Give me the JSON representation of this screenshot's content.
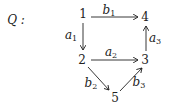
{
  "diagram": {
    "title": "Q :",
    "nodes": [
      {
        "id": "1",
        "label": "1",
        "x": 83,
        "y": 14
      },
      {
        "id": "2",
        "label": "2",
        "x": 82,
        "y": 60
      },
      {
        "id": "3",
        "label": "3",
        "x": 145,
        "y": 60
      },
      {
        "id": "4",
        "label": "4",
        "x": 145,
        "y": 17
      },
      {
        "id": "5",
        "label": "5",
        "x": 115,
        "y": 98
      }
    ],
    "edges": [
      {
        "id": "b1",
        "name": "b",
        "sub": "1",
        "from": "1",
        "to": "4",
        "lx": 109,
        "ly": 11
      },
      {
        "id": "a1",
        "name": "a",
        "sub": "1",
        "from": "1",
        "to": "2",
        "lx": 71,
        "ly": 36
      },
      {
        "id": "a2",
        "name": "a",
        "sub": "2",
        "from": "2",
        "to": "3",
        "lx": 111,
        "ly": 53
      },
      {
        "id": "a3",
        "name": "a",
        "sub": "3",
        "from": "3",
        "to": "4",
        "lx": 155,
        "ly": 39
      },
      {
        "id": "b2",
        "name": "b",
        "sub": "2",
        "from": "2",
        "to": "5",
        "lx": 91,
        "ly": 84
      },
      {
        "id": "b3",
        "name": "b",
        "sub": "3",
        "from": "5",
        "to": "3",
        "lx": 139,
        "ly": 83
      }
    ]
  }
}
